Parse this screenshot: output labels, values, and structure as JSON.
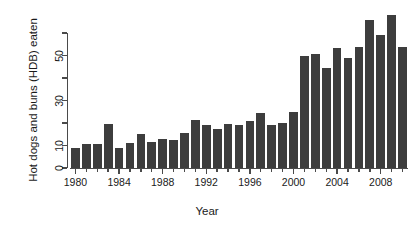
{
  "chart_data": {
    "type": "bar",
    "title": "",
    "xlabel": "Year",
    "ylabel": "Hot dogs and buns (HDB) eaten",
    "categories": [
      1980,
      1981,
      1982,
      1983,
      1984,
      1985,
      1986,
      1987,
      1988,
      1989,
      1990,
      1991,
      1992,
      1993,
      1994,
      1995,
      1996,
      1997,
      1998,
      1999,
      2000,
      2001,
      2002,
      2003,
      2004,
      2005,
      2006,
      2007,
      2008,
      2009,
      2010
    ],
    "values": [
      9,
      10.75,
      10.75,
      19.5,
      9,
      11.25,
      15,
      11.5,
      13,
      12.25,
      15.5,
      21.5,
      19,
      17.5,
      19.5,
      19.25,
      21,
      24.5,
      19,
      20,
      25,
      50,
      50.5,
      44.5,
      53.5,
      49,
      54,
      66,
      59,
      68,
      54
    ],
    "xlim": [
      1979.5,
      2010.5
    ],
    "ylim": [
      0,
      62
    ],
    "y_ticks": [
      0,
      10,
      20,
      30,
      40,
      50,
      60
    ],
    "y_tick_labels": [
      "0",
      "10",
      "",
      "30",
      "",
      "50",
      ""
    ],
    "x_ticks": [
      1980,
      1984,
      1988,
      1992,
      1996,
      2000,
      2004,
      2008
    ],
    "x_tick_labels": [
      "1980",
      "1984",
      "1988",
      "1992",
      "1996",
      "2000",
      "2004",
      "2008"
    ],
    "grid": false,
    "legend": null,
    "bar_color": "#3d3d3d",
    "axis_color": "#4a4a4a",
    "background": "#ffffff"
  }
}
